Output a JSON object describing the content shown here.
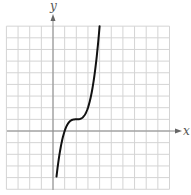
{
  "chart_data": {
    "type": "line",
    "title": "",
    "xlabel": "x",
    "ylabel": "y",
    "function": "y = (x - 2)^3 + 1",
    "grid": true,
    "xlim": [
      -4,
      10
    ],
    "ylim": [
      -5,
      9
    ],
    "x": [
      0.3,
      0.6,
      1.0,
      1.4,
      1.8,
      2.0,
      2.2,
      2.6,
      3.0,
      3.4,
      3.8,
      4.0
    ],
    "series": [
      {
        "name": "f(x)",
        "values": [
          -3.91,
          -1.74,
          0.0,
          0.78,
          0.99,
          1.0,
          1.01,
          1.22,
          2.0,
          3.74,
          6.83,
          9.0
        ]
      }
    ],
    "annotations": []
  },
  "axes": {
    "x_label": "x",
    "y_label": "y"
  },
  "colors": {
    "grid": "#d4d4d4",
    "axis": "#8a8a8a",
    "curve": "#111111"
  }
}
